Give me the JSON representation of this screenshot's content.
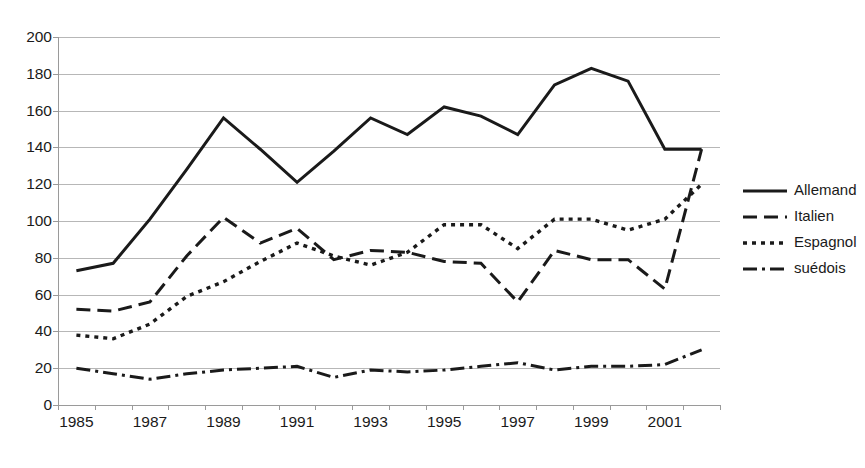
{
  "chart_data": {
    "type": "line",
    "title": "",
    "subtitle": "",
    "xlabel": "",
    "ylabel": "",
    "ylim": [
      0,
      200
    ],
    "ytick_step": 20,
    "grid": true,
    "legend_position": "right",
    "x": [
      1985,
      1986,
      1987,
      1988,
      1989,
      1990,
      1991,
      1992,
      1993,
      1994,
      1995,
      1996,
      1997,
      1998,
      1999,
      2000,
      2001,
      2002
    ],
    "xtick_labels": [
      "1985",
      "1987",
      "1989",
      "1991",
      "1993",
      "1995",
      "1997",
      "1999",
      "2001"
    ],
    "ytick_labels": [
      "0",
      "20",
      "40",
      "60",
      "80",
      "100",
      "120",
      "140",
      "160",
      "180",
      "200"
    ],
    "series": [
      {
        "name": "Allemand",
        "style": "solid",
        "color": "#1a1a1a",
        "values": [
          73,
          77,
          101,
          128,
          156,
          139,
          121,
          138,
          156,
          147,
          162,
          157,
          147,
          174,
          183,
          176,
          139,
          139
        ]
      },
      {
        "name": "Italien",
        "style": "dashed",
        "color": "#1a1a1a",
        "values": [
          52,
          51,
          56,
          81,
          102,
          88,
          96,
          79,
          84,
          83,
          78,
          77,
          56,
          84,
          79,
          79,
          63,
          139
        ]
      },
      {
        "name": "Espagnol",
        "style": "dotted",
        "color": "#1a1a1a",
        "values": [
          38,
          36,
          44,
          59,
          67,
          78,
          88,
          81,
          76,
          83,
          98,
          98,
          85,
          101,
          101,
          95,
          101,
          120
        ]
      },
      {
        "name": "suédois",
        "style": "dashdot",
        "color": "#1a1a1a",
        "values": [
          20,
          17,
          14,
          17,
          19,
          20,
          21,
          15,
          19,
          18,
          19,
          21,
          23,
          19,
          21,
          21,
          22,
          30
        ]
      }
    ]
  },
  "legend": {
    "items": [
      {
        "label": "Allemand",
        "style": "solid"
      },
      {
        "label": "Italien",
        "style": "dashed"
      },
      {
        "label": "Espagnol",
        "style": "dotted"
      },
      {
        "label": "suédois",
        "style": "dashdot"
      }
    ]
  }
}
